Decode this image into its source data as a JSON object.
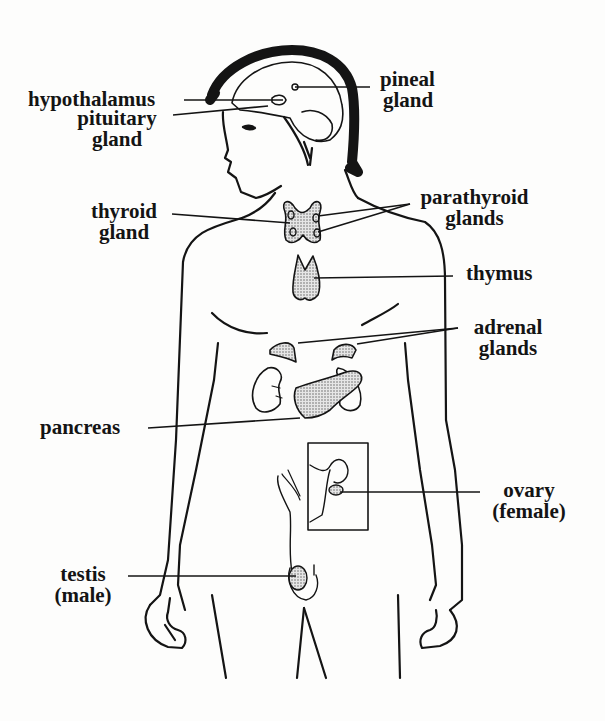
{
  "diagram": {
    "type": "anatomical illustration",
    "colors": {
      "line": "#141414",
      "background": "#fdfdfc",
      "stipple": "#9a9a9a"
    },
    "labels": {
      "hypothalamus": {
        "line1": "hypothalamus"
      },
      "pituitary": {
        "line1": "pituitary",
        "line2": "gland"
      },
      "pineal": {
        "line1": "pineal",
        "line2": "gland"
      },
      "thyroid": {
        "line1": "thyroid",
        "line2": "gland"
      },
      "parathyroid": {
        "line1": "parathyroid",
        "line2": "glands"
      },
      "thymus": {
        "line1": "thymus"
      },
      "adrenal": {
        "line1": "adrenal",
        "line2": "glands"
      },
      "pancreas": {
        "line1": "pancreas"
      },
      "ovary": {
        "line1": "ovary",
        "line2": "(female)"
      },
      "testis": {
        "line1": "testis",
        "line2": "(male)"
      }
    }
  }
}
